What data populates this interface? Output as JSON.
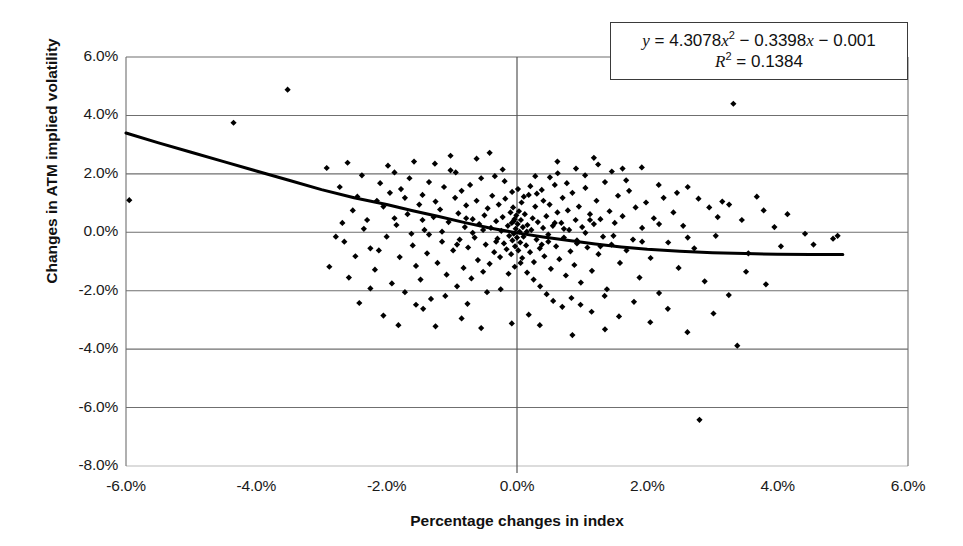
{
  "chart_data": {
    "type": "scatter",
    "title": "",
    "xlabel": "Percentage changes in index",
    "ylabel": "Changes in ATM implied volatility",
    "xlim": [
      -6.0,
      6.0
    ],
    "ylim": [
      -8.0,
      6.0
    ],
    "x_tick_labels": [
      "-6.0%",
      "-4.0%",
      "-2.0%",
      "0.0%",
      "2.0%",
      "4.0%",
      "6.0%"
    ],
    "x_ticks": [
      -6.0,
      -4.0,
      -2.0,
      0.0,
      2.0,
      4.0,
      6.0
    ],
    "y_tick_labels": [
      "6.0%",
      "4.0%",
      "2.0%",
      "0.0%",
      "-2.0%",
      "-4.0%",
      "-6.0%",
      "-8.0%"
    ],
    "y_ticks": [
      6.0,
      4.0,
      2.0,
      0.0,
      -2.0,
      -4.0,
      -6.0,
      -8.0
    ],
    "grid": "horizontal",
    "legend": "none",
    "marker": "diamond",
    "marker_color": "#000000",
    "trendline": {
      "type": "quadratic",
      "equation": "y = 4.3078x² − 0.3398x − 0.001",
      "r_squared": "R² = 0.1384",
      "coefficients": {
        "a": 4.3078,
        "b": -0.3398,
        "c": -0.001
      },
      "color": "#000000",
      "width_px": 3,
      "x_start": -6.0,
      "x_end": 5.0,
      "points": [
        [
          -6.0,
          3.4
        ],
        [
          -5.5,
          3.06
        ],
        [
          -5.0,
          2.74
        ],
        [
          -4.5,
          2.42
        ],
        [
          -4.0,
          2.1
        ],
        [
          -3.5,
          1.78
        ],
        [
          -3.0,
          1.46
        ],
        [
          -2.5,
          1.18
        ],
        [
          -2.0,
          0.95
        ],
        [
          -1.6,
          0.74
        ],
        [
          -1.2,
          0.54
        ],
        [
          -0.8,
          0.33
        ],
        [
          -0.4,
          0.14
        ],
        [
          0.0,
          -0.02
        ],
        [
          0.4,
          -0.16
        ],
        [
          0.8,
          -0.28
        ],
        [
          1.2,
          -0.4
        ],
        [
          1.6,
          -0.5
        ],
        [
          2.0,
          -0.58
        ],
        [
          2.5,
          -0.65
        ],
        [
          3.0,
          -0.7
        ],
        [
          3.5,
          -0.73
        ],
        [
          4.0,
          -0.75
        ],
        [
          4.5,
          -0.76
        ],
        [
          5.0,
          -0.76
        ]
      ]
    },
    "equation_annotation": {
      "line1": "y = 4.3078x² − 0.3398x − 0.001",
      "line2": "R² = 0.1384",
      "position": "top-right",
      "boxed": true
    },
    "point_count": 302,
    "points": [
      [
        -5.95,
        1.1
      ],
      [
        -3.52,
        4.88
      ],
      [
        -4.35,
        3.75
      ],
      [
        -2.92,
        2.2
      ],
      [
        -2.72,
        1.55
      ],
      [
        -2.6,
        2.38
      ],
      [
        -2.45,
        1.22
      ],
      [
        -2.38,
        1.95
      ],
      [
        -2.3,
        0.42
      ],
      [
        -2.25,
        -0.55
      ],
      [
        -2.18,
        -1.28
      ],
      [
        -2.1,
        1.68
      ],
      [
        -2.05,
        0.88
      ],
      [
        -2.0,
        -0.15
      ],
      [
        -1.95,
        1.35
      ],
      [
        -1.92,
        -1.75
      ],
      [
        -1.88,
        2.05
      ],
      [
        -1.85,
        0.25
      ],
      [
        -1.8,
        -0.85
      ],
      [
        -1.78,
        1.48
      ],
      [
        -1.72,
        -2.05
      ],
      [
        -1.68,
        0.62
      ],
      [
        -1.65,
        1.85
      ],
      [
        -1.6,
        -0.45
      ],
      [
        -1.58,
        2.42
      ],
      [
        -1.55,
        -1.15
      ],
      [
        -1.5,
        0.95
      ],
      [
        -1.48,
        -1.62
      ],
      [
        -1.45,
        1.28
      ],
      [
        -1.42,
        0.08
      ],
      [
        -1.38,
        -0.72
      ],
      [
        -1.35,
        1.72
      ],
      [
        -1.32,
        -2.28
      ],
      [
        -1.28,
        0.52
      ],
      [
        -1.25,
        1.05
      ],
      [
        -1.22,
        -1.05
      ],
      [
        -1.18,
        0.78
      ],
      [
        -1.15,
        -0.32
      ],
      [
        -1.12,
        1.55
      ],
      [
        -1.08,
        -1.45
      ],
      [
        -1.05,
        0.35
      ],
      [
        -1.02,
        2.12
      ],
      [
        -0.98,
        -0.62
      ],
      [
        -0.95,
        1.18
      ],
      [
        -0.92,
        -1.85
      ],
      [
        -0.9,
        0.65
      ],
      [
        -0.88,
        -0.25
      ],
      [
        -0.85,
        1.42
      ],
      [
        -0.82,
        -1.22
      ],
      [
        -0.8,
        0.18
      ],
      [
        -0.78,
        0.92
      ],
      [
        -0.75,
        -0.52
      ],
      [
        -0.72,
        1.62
      ],
      [
        -0.7,
        -1.58
      ],
      [
        -0.68,
        0.45
      ],
      [
        -0.65,
        -0.18
      ],
      [
        -0.62,
        1.08
      ],
      [
        -0.6,
        -0.95
      ],
      [
        -0.58,
        0.28
      ],
      [
        -0.55,
        1.85
      ],
      [
        -0.52,
        -1.35
      ],
      [
        -0.5,
        0.58
      ],
      [
        -0.48,
        -0.42
      ],
      [
        -0.45,
        0.82
      ],
      [
        -0.42,
        -1.08
      ],
      [
        -0.4,
        0.15
      ],
      [
        -0.38,
        1.25
      ],
      [
        -0.35,
        -0.68
      ],
      [
        -0.32,
        0.38
      ],
      [
        -0.3,
        -0.22
      ],
      [
        -0.28,
        0.95
      ],
      [
        -0.26,
        -0.85
      ],
      [
        -0.24,
        0.05
      ],
      [
        -0.22,
        0.52
      ],
      [
        -0.2,
        -0.38
      ],
      [
        -0.18,
        1.15
      ],
      [
        -0.16,
        -0.58
      ],
      [
        -0.14,
        0.22
      ],
      [
        -0.12,
        -0.12
      ],
      [
        -0.1,
        0.68
      ],
      [
        -0.09,
        -0.75
      ],
      [
        -0.08,
        0.32
      ],
      [
        -0.07,
        -0.28
      ],
      [
        -0.06,
        0.85
      ],
      [
        -0.05,
        -0.05
      ],
      [
        -0.04,
        0.45
      ],
      [
        -0.03,
        -0.48
      ],
      [
        -0.02,
        0.12
      ],
      [
        -0.01,
        0.58
      ],
      [
        0.0,
        -0.18
      ],
      [
        0.01,
        0.28
      ],
      [
        0.02,
        -0.62
      ],
      [
        0.03,
        0.72
      ],
      [
        0.04,
        0.02
      ],
      [
        0.05,
        -0.35
      ],
      [
        0.06,
        0.42
      ],
      [
        0.07,
        1.02
      ],
      [
        0.08,
        -0.88
      ],
      [
        0.09,
        0.18
      ],
      [
        0.1,
        -0.15
      ],
      [
        0.12,
        0.62
      ],
      [
        0.14,
        -0.45
      ],
      [
        0.16,
        0.25
      ],
      [
        0.18,
        1.28
      ],
      [
        0.2,
        -0.68
      ],
      [
        0.22,
        0.08
      ],
      [
        0.24,
        0.48
      ],
      [
        0.26,
        -1.02
      ],
      [
        0.28,
        0.88
      ],
      [
        0.3,
        -0.25
      ],
      [
        0.32,
        0.35
      ],
      [
        0.35,
        -0.55
      ],
      [
        0.38,
        1.45
      ],
      [
        0.4,
        0.15
      ],
      [
        0.42,
        -0.82
      ],
      [
        0.45,
        0.55
      ],
      [
        0.48,
        -0.32
      ],
      [
        0.5,
        0.95
      ],
      [
        0.52,
        -1.25
      ],
      [
        0.55,
        0.22
      ],
      [
        0.58,
        1.62
      ],
      [
        0.6,
        -0.48
      ],
      [
        0.62,
        0.68
      ],
      [
        0.65,
        -0.92
      ],
      [
        0.68,
        0.32
      ],
      [
        0.7,
        1.18
      ],
      [
        0.72,
        -0.18
      ],
      [
        0.75,
        -1.48
      ],
      [
        0.78,
        0.75
      ],
      [
        0.8,
        0.08
      ],
      [
        0.82,
        -0.65
      ],
      [
        0.85,
        1.35
      ],
      [
        0.88,
        -1.12
      ],
      [
        0.9,
        0.42
      ],
      [
        0.92,
        -0.28
      ],
      [
        0.95,
        0.88
      ],
      [
        0.98,
        -1.72
      ],
      [
        1.0,
        0.18
      ],
      [
        1.05,
        1.52
      ],
      [
        1.08,
        -0.52
      ],
      [
        1.12,
        0.62
      ],
      [
        1.15,
        -1.32
      ],
      [
        1.18,
        0.28
      ],
      [
        1.22,
        1.08
      ],
      [
        1.25,
        -0.75
      ],
      [
        1.28,
        0.45
      ],
      [
        1.32,
        -0.15
      ],
      [
        1.35,
        1.72
      ],
      [
        1.38,
        -1.95
      ],
      [
        1.42,
        0.72
      ],
      [
        1.45,
        -0.42
      ],
      [
        1.5,
        0.32
      ],
      [
        1.55,
        1.25
      ],
      [
        1.58,
        -1.05
      ],
      [
        1.62,
        0.55
      ],
      [
        1.68,
        -0.62
      ],
      [
        1.72,
        1.42
      ],
      [
        1.78,
        -0.25
      ],
      [
        1.82,
        0.85
      ],
      [
        1.88,
        -1.55
      ],
      [
        1.92,
        0.15
      ],
      [
        1.98,
        1.02
      ],
      [
        2.05,
        -0.88
      ],
      [
        2.1,
        0.48
      ],
      [
        2.18,
        -2.08
      ],
      [
        2.25,
        1.18
      ],
      [
        2.32,
        -0.35
      ],
      [
        2.4,
        0.68
      ],
      [
        2.48,
        -1.22
      ],
      [
        2.55,
        0.22
      ],
      [
        2.62,
        1.55
      ],
      [
        2.72,
        -0.55
      ],
      [
        2.8,
        -6.42
      ],
      [
        2.88,
        -1.68
      ],
      [
        2.95,
        0.85
      ],
      [
        3.05,
        -0.12
      ],
      [
        3.15,
        1.05
      ],
      [
        3.25,
        -2.15
      ],
      [
        3.32,
        4.4
      ],
      [
        3.38,
        -3.88
      ],
      [
        3.45,
        0.42
      ],
      [
        3.55,
        -0.72
      ],
      [
        3.68,
        1.22
      ],
      [
        3.82,
        -1.78
      ],
      [
        3.95,
        0.18
      ],
      [
        4.15,
        0.62
      ],
      [
        4.42,
        -0.05
      ],
      [
        4.85,
        -0.22
      ],
      [
        4.92,
        -0.12
      ],
      [
        -2.88,
        -1.18
      ],
      [
        -2.65,
        -0.32
      ],
      [
        -2.52,
        0.75
      ],
      [
        -2.42,
        -2.42
      ],
      [
        -2.12,
        -0.62
      ],
      [
        -1.98,
        2.28
      ],
      [
        -1.82,
        -3.18
      ],
      [
        -1.62,
        -0.05
      ],
      [
        -1.44,
        -2.62
      ],
      [
        -1.26,
        2.35
      ],
      [
        -1.1,
        -2.18
      ],
      [
        -0.94,
        2.05
      ],
      [
        -0.76,
        -2.45
      ],
      [
        -0.62,
        2.52
      ],
      [
        -0.46,
        -2.05
      ],
      [
        -0.34,
        1.92
      ],
      [
        -0.25,
        -1.95
      ],
      [
        -0.19,
        1.75
      ],
      [
        -0.13,
        -1.42
      ],
      [
        -0.075,
        1.38
      ],
      [
        -0.035,
        -1.18
      ],
      [
        0.015,
        1.48
      ],
      [
        0.055,
        -1.05
      ],
      [
        0.105,
        1.22
      ],
      [
        0.155,
        -1.38
      ],
      [
        0.205,
        1.58
      ],
      [
        0.255,
        -1.62
      ],
      [
        0.305,
        1.32
      ],
      [
        0.355,
        -1.85
      ],
      [
        0.405,
        1.08
      ],
      [
        0.455,
        -2.12
      ],
      [
        0.505,
        1.88
      ],
      [
        0.555,
        -2.35
      ],
      [
        0.625,
        2.02
      ],
      [
        0.695,
        -2.55
      ],
      [
        0.765,
        1.68
      ],
      [
        0.835,
        -2.25
      ],
      [
        0.905,
        2.18
      ],
      [
        0.975,
        -2.48
      ],
      [
        1.045,
        1.95
      ],
      [
        1.145,
        -2.72
      ],
      [
        1.245,
        2.32
      ],
      [
        1.345,
        -2.18
      ],
      [
        1.455,
        2.08
      ],
      [
        1.565,
        -2.88
      ],
      [
        1.675,
        1.78
      ],
      [
        1.795,
        -2.38
      ],
      [
        1.915,
        2.22
      ],
      [
        2.045,
        -3.08
      ],
      [
        2.175,
        1.62
      ],
      [
        2.315,
        -2.62
      ],
      [
        2.455,
        1.35
      ],
      [
        2.615,
        -3.42
      ],
      [
        2.785,
        1.15
      ],
      [
        3.015,
        -2.78
      ],
      [
        3.255,
        0.95
      ],
      [
        3.515,
        -1.35
      ],
      [
        3.785,
        0.75
      ],
      [
        -0.55,
        -3.28
      ],
      [
        -1.25,
        -3.22
      ],
      [
        -2.05,
        -2.85
      ],
      [
        -0.85,
        -2.95
      ],
      [
        0.35,
        -3.18
      ],
      [
        0.85,
        -3.52
      ],
      [
        -1.55,
        -2.48
      ],
      [
        -2.25,
        -1.92
      ],
      [
        -2.58,
        -1.55
      ],
      [
        0.18,
        -2.82
      ],
      [
        -0.08,
        -3.12
      ],
      [
        1.35,
        -3.32
      ],
      [
        -1.02,
        2.62
      ],
      [
        -0.42,
        2.72
      ],
      [
        0.62,
        2.42
      ],
      [
        1.18,
        2.55
      ],
      [
        1.62,
        2.18
      ],
      [
        -1.72,
        1.18
      ],
      [
        -2.35,
        0.12
      ],
      [
        -2.48,
        -0.82
      ],
      [
        2.18,
        0.28
      ],
      [
        2.62,
        -0.18
      ],
      [
        -0.22,
        2.15
      ],
      [
        0.28,
        1.92
      ],
      [
        -1.88,
        0.48
      ],
      [
        -2.15,
        1.08
      ],
      [
        3.08,
        0.52
      ],
      [
        -1.35,
        -0.08
      ],
      [
        -0.68,
        -0.02
      ],
      [
        0.48,
        -0.08
      ],
      [
        1.05,
        -0.02
      ],
      [
        1.92,
        -0.32
      ],
      [
        -1.15,
        0.02
      ],
      [
        -0.52,
        0.08
      ],
      [
        0.15,
        0.02
      ],
      [
        0.72,
        0.12
      ],
      [
        1.48,
        -0.12
      ],
      [
        -0.92,
        -0.42
      ],
      [
        -0.32,
        -0.32
      ],
      [
        0.38,
        -0.42
      ],
      [
        0.92,
        -0.38
      ],
      [
        1.28,
        -0.48
      ],
      [
        -1.45,
        0.42
      ],
      [
        -0.78,
        0.48
      ],
      [
        -0.05,
        0.38
      ],
      [
        0.58,
        0.32
      ],
      [
        1.12,
        0.42
      ],
      [
        -2.68,
        0.32
      ],
      [
        -2.78,
        -0.15
      ],
      [
        4.05,
        -0.48
      ],
      [
        4.55,
        -0.42
      ]
    ]
  },
  "equation": {
    "y_prefix": "y",
    "eq_sign": "=",
    "coeff_a": "4.3078",
    "x_var": "x",
    "exp": "2",
    "term_b": "− 0.3398",
    "x_var2": "x",
    "term_c": "− 0.001",
    "r_label": "R",
    "r_exp": "2",
    "r_eq": "=",
    "r_value": "0.1384"
  }
}
